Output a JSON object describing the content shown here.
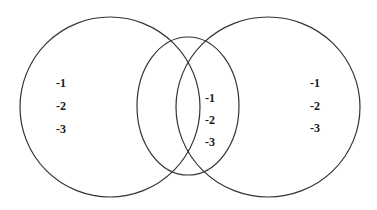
{
  "diagram": {
    "type": "venn",
    "stroke_color": "#333333",
    "text_color": "#1a1a1a",
    "background": "#ffffff",
    "sets": [
      {
        "id": "left",
        "cx": 110,
        "cy": 107,
        "rx": 90,
        "ry": 90
      },
      {
        "id": "middle",
        "cx": 188,
        "cy": 106,
        "rx": 51,
        "ry": 69
      },
      {
        "id": "right",
        "cx": 268,
        "cy": 107,
        "rx": 92,
        "ry": 90
      }
    ],
    "regions": {
      "left": {
        "items": [
          "-1",
          "-2",
          "-3"
        ]
      },
      "middle": {
        "items": [
          "-1",
          "-2",
          "-3"
        ]
      },
      "right": {
        "items": [
          "-1",
          "-2",
          "-3"
        ]
      }
    }
  }
}
